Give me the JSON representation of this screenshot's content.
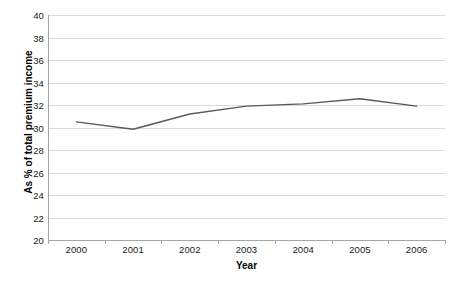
{
  "chart_data": {
    "type": "line",
    "title": "",
    "xlabel": "Year",
    "ylabel": "As % of total premium income",
    "categories": [
      "2000",
      "2001",
      "2002",
      "2003",
      "2004",
      "2005",
      "2006"
    ],
    "values": [
      30.5,
      29.85,
      31.2,
      31.9,
      32.1,
      32.55,
      31.9
    ],
    "series": [
      {
        "name": "",
        "values": [
          30.5,
          29.85,
          31.2,
          31.9,
          32.1,
          32.55,
          31.9
        ]
      }
    ],
    "ylim": [
      20,
      40
    ],
    "ytick_step": 2,
    "yticks": [
      "40",
      "38",
      "36",
      "34",
      "32",
      "30",
      "28",
      "26",
      "24",
      "22",
      "20"
    ],
    "grid": true,
    "grid_axis": "y",
    "legend": "none",
    "line_color": "#595959",
    "grid_color": "#d9d9d9",
    "axis_color": "#a6a6a6",
    "text_color": "#1a1a1a"
  }
}
